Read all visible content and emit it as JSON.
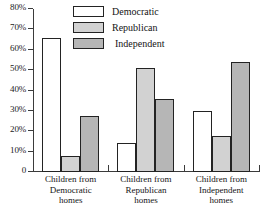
{
  "chart_data": {
    "type": "bar",
    "title": "",
    "xlabel": "",
    "ylabel": "",
    "ylim": [
      0,
      80
    ],
    "grid": false,
    "legend_position": "top-center",
    "y_ticks": [
      "0",
      "10%",
      "20%",
      "30%",
      "40%",
      "50%",
      "60%",
      "70%",
      "80%"
    ],
    "y_tick_values": [
      0,
      10,
      20,
      30,
      40,
      50,
      60,
      70,
      80
    ],
    "categories": [
      "Children from Democratic homes",
      "Children from Republican homes",
      "Children from Independent homes"
    ],
    "category_lines": [
      [
        "Children from",
        "Democratic",
        "homes"
      ],
      [
        "Children from",
        "Republican",
        "homes"
      ],
      [
        "Children from",
        "Independent",
        "homes"
      ]
    ],
    "series": [
      {
        "name": "Democratic",
        "color": "#ffffff",
        "values": [
          66,
          14,
          30
        ]
      },
      {
        "name": "Republican",
        "color": "#d2d2d2",
        "values": [
          8,
          51,
          17.5
        ]
      },
      {
        "name": "Independent",
        "color": "#b6b6b6",
        "values": [
          27.5,
          36,
          54
        ]
      }
    ]
  },
  "legend": {
    "items": [
      {
        "label": "Democratic"
      },
      {
        "label": "Republican"
      },
      {
        "label": "Independent"
      }
    ]
  },
  "axis": {
    "y_labels": [
      "80%",
      "70%",
      "60%",
      "50%",
      "40%",
      "30%",
      "20%",
      "10%",
      "0"
    ]
  }
}
